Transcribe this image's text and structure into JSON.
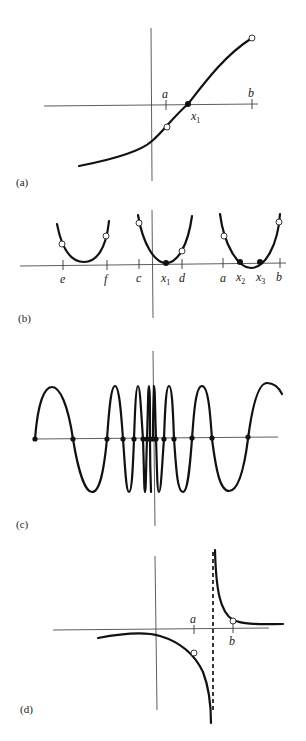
{
  "panels": [
    {
      "id": "a",
      "label": "(a)",
      "ticks": [
        {
          "name": "a",
          "label": "a"
        },
        {
          "name": "b",
          "label": "b"
        }
      ],
      "roots": [
        {
          "label": "x",
          "sub": "1"
        }
      ]
    },
    {
      "id": "b",
      "label": "(b)",
      "ticks": [
        {
          "label": "e"
        },
        {
          "label": "f"
        },
        {
          "label": "c"
        },
        {
          "label": "d"
        },
        {
          "label": "a"
        },
        {
          "label": "b"
        }
      ],
      "roots": [
        {
          "label": "x",
          "sub": "1"
        },
        {
          "label": "x",
          "sub": "2"
        },
        {
          "label": "x",
          "sub": "3"
        }
      ]
    },
    {
      "id": "c",
      "label": "(c)",
      "description": "oscillating function with infinitely many roots accumulating at origin"
    },
    {
      "id": "d",
      "label": "(d)",
      "ticks": [
        {
          "label": "a"
        },
        {
          "label": "b"
        }
      ],
      "description": "function with vertical asymptote between a and b"
    }
  ]
}
